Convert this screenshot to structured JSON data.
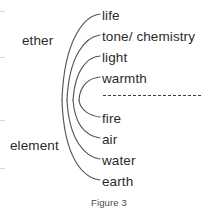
{
  "figure": {
    "caption": "Figure 3",
    "background_color": "#ffffff",
    "text_color": "#2b2b2b",
    "line_color": "#555555"
  },
  "groups": [
    {
      "label": "ether",
      "covers": [
        "life",
        "tone/ chemistry",
        "light",
        "warmth"
      ]
    },
    {
      "label": "element",
      "covers": [
        "fire",
        "air",
        "water",
        "earth"
      ]
    }
  ],
  "group_labels": {
    "upper": "ether",
    "lower": "element"
  },
  "items": [
    {
      "label": "life",
      "y": 9,
      "group": "ether"
    },
    {
      "label": "tone/ chemistry",
      "y": 30,
      "group": "ether"
    },
    {
      "label": "light",
      "y": 51,
      "group": "ether"
    },
    {
      "label": "warmth",
      "y": 72,
      "group": "ether"
    },
    {
      "label": "fire",
      "y": 112,
      "group": "element"
    },
    {
      "label": "air",
      "y": 133,
      "group": "element"
    },
    {
      "label": "water",
      "y": 154,
      "group": "element"
    },
    {
      "label": "earth",
      "y": 175,
      "group": "element"
    }
  ],
  "divider": {
    "style": "dashed",
    "separates": [
      "ether",
      "element"
    ]
  },
  "scan_marks": [
    {
      "x": 0,
      "y": 11
    },
    {
      "x": 0,
      "y": 57
    },
    {
      "x": 0,
      "y": 120
    },
    {
      "x": 0,
      "y": 168
    }
  ]
}
